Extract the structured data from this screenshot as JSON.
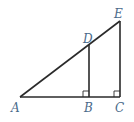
{
  "diagram": {
    "type": "geometry",
    "points": {
      "A": {
        "label": "A",
        "x": 20,
        "y": 97
      },
      "B": {
        "label": "B",
        "x": 89,
        "y": 97
      },
      "C": {
        "label": "C",
        "x": 120,
        "y": 97
      },
      "D": {
        "label": "D",
        "x": 89,
        "y": 45
      },
      "E": {
        "label": "E",
        "x": 120,
        "y": 21
      }
    },
    "segments": [
      "AC",
      "AE",
      "BD",
      "CE"
    ],
    "right_angles": [
      "B",
      "C"
    ],
    "colors": {
      "line": "#2a2a2a",
      "label": "#4a6a8a"
    }
  }
}
